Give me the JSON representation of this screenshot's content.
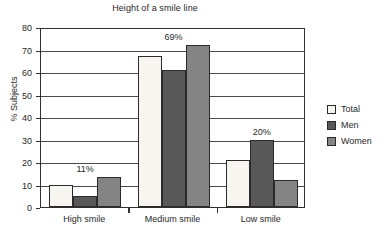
{
  "chart_data": {
    "type": "bar",
    "title": "Height of a smile line",
    "xlabel": "",
    "ylabel": "% Subjects",
    "ylim": [
      0,
      80
    ],
    "ytick_step": 10,
    "yticks": [
      "80",
      "70",
      "60",
      "50",
      "40",
      "30",
      "20",
      "10",
      "0"
    ],
    "grid": true,
    "legend_position": "right",
    "categories": [
      "High smile",
      "Medium smile",
      "Low smile"
    ],
    "series": [
      {
        "name": "Total",
        "color": "#f6f5f0",
        "values": [
          10,
          67,
          21
        ]
      },
      {
        "name": "Men",
        "color": "#585858",
        "values": [
          5,
          61,
          30
        ]
      },
      {
        "name": "Women",
        "color": "#848484",
        "values": [
          13.5,
          72,
          12
        ]
      }
    ],
    "annotations": [
      {
        "text": "11%",
        "category": "High smile"
      },
      {
        "text": "69%",
        "category": "Medium smile"
      },
      {
        "text": "20%",
        "category": "Low smile"
      }
    ]
  },
  "legend": {
    "items": [
      {
        "label": "Total",
        "swatch": "#f6f5f0"
      },
      {
        "label": "Men",
        "swatch": "#585858"
      },
      {
        "label": "Women",
        "swatch": "#848484"
      }
    ]
  },
  "axis": {
    "y_title": "% Subjects",
    "y_labels": [
      "80",
      "70",
      "60",
      "50",
      "40",
      "30",
      "20",
      "10",
      "0"
    ],
    "x_labels": [
      "High smile",
      "Medium smile",
      "Low smile"
    ]
  },
  "colors": {
    "total": "#f6f5f0",
    "men": "#585858",
    "women": "#848484",
    "axis": "#303030",
    "grid": "#4a4a4a",
    "text": "#1f1f1f",
    "background": "#ffffff"
  }
}
